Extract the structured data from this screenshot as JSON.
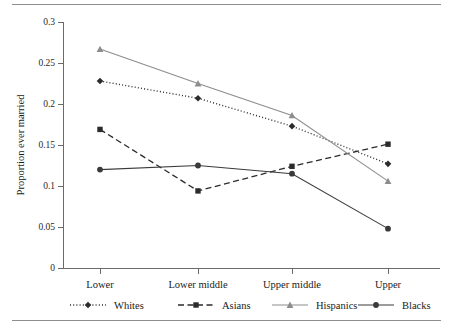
{
  "chart_data": {
    "type": "line",
    "title": "",
    "xlabel": "",
    "ylabel": "Proportion ever married",
    "categories": [
      "Lower",
      "Lower middle",
      "Upper middle",
      "Upper"
    ],
    "ylim": [
      0,
      0.3
    ],
    "ytick_labels": [
      "0",
      "0.05",
      "0.1",
      "0.15",
      "0.2",
      "0.25",
      "0.3"
    ],
    "ytick_values": [
      0,
      0.05,
      0.1,
      0.15,
      0.2,
      0.25,
      0.3
    ],
    "grid": false,
    "legend_position": "bottom",
    "series": [
      {
        "name": "Whites",
        "values": [
          0.228,
          0.207,
          0.173,
          0.127
        ],
        "line_style": "dotted",
        "marker": "diamond",
        "color": "#2b2b2b"
      },
      {
        "name": "Asians",
        "values": [
          0.169,
          0.094,
          0.124,
          0.151
        ],
        "line_style": "dashed",
        "marker": "square",
        "color": "#2b2b2b"
      },
      {
        "name": "Hispanics",
        "values": [
          0.267,
          0.225,
          0.186,
          0.106
        ],
        "line_style": "solid",
        "marker": "triangle",
        "color": "#8d8d8d"
      },
      {
        "name": "Blacks",
        "values": [
          0.12,
          0.125,
          0.115,
          0.048
        ],
        "line_style": "solid",
        "marker": "circle",
        "color": "#3a3a3a"
      }
    ]
  },
  "legend": {
    "items": [
      {
        "label": "Whites"
      },
      {
        "label": "Asians"
      },
      {
        "label": "Hispanics"
      },
      {
        "label": "Blacks"
      }
    ]
  },
  "axes": {
    "y_title": "Proportion ever married"
  }
}
